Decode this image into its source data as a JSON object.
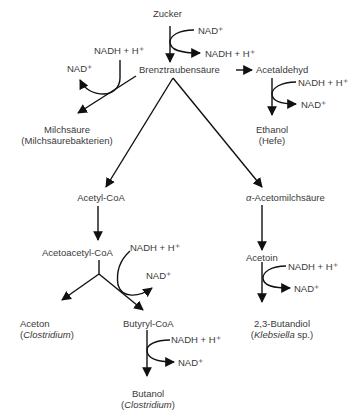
{
  "diagram": {
    "colors": {
      "text": "#3a3a3a",
      "line": "#111111",
      "background": "#ffffff"
    },
    "nodes": {
      "zucker": "Zucker",
      "brenztraubensaeure": "Brenztraubensäure",
      "acetaldehyd": "Acetaldehyd",
      "ethanol": "Ethanol",
      "ethanol_org": "(Hefe)",
      "milchsaeure": "Milchsäure",
      "milchsaeure_org": "(Milchsäurebakterien)",
      "acetyl_coa": "Acetyl-CoA",
      "acetomilchsaeure_prefix": "α",
      "acetomilchsaeure_rest": "-Acetomilchsäure",
      "acetoacetyl_coa": "Acetoacetyl-CoA",
      "aceton": "Aceton",
      "aceton_org_open": "(",
      "aceton_org": "Clostridium",
      "aceton_org_close": ")",
      "butyryl_coa": "Butyryl-CoA",
      "butanol": "Butanol",
      "butanol_org_open": "(",
      "butanol_org": "Clostridium",
      "butanol_org_close": ")",
      "acetoin": "Acetoin",
      "butandiol": "2,3-Butandiol",
      "butandiol_org_open": "(",
      "butandiol_org": "Klebsiella",
      "butandiol_org_rest": " sp.)"
    },
    "cofactors": {
      "nad": "NAD⁺",
      "nadh": "NADH + H⁺"
    }
  }
}
